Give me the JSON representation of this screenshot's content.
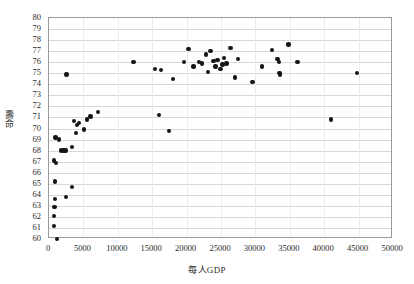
{
  "chart_data": {
    "type": "scatter",
    "title": "",
    "xlabel": "每人GDP",
    "ylabel": "壽命",
    "xlim": [
      0,
      50000
    ],
    "ylim": [
      60,
      80
    ],
    "xticks": [
      0,
      5000,
      10000,
      15000,
      20000,
      25000,
      30000,
      35000,
      40000,
      45000,
      50000
    ],
    "yticks": [
      60,
      61,
      62,
      63,
      64,
      65,
      66,
      67,
      68,
      69,
      70,
      71,
      72,
      73,
      74,
      75,
      76,
      77,
      78,
      79,
      80
    ],
    "grid": "horizontal",
    "legend": "none",
    "marker_color": "#151515",
    "series": [
      {
        "name": "國家",
        "points": [
          [
            1150,
            60.0
          ],
          [
            700,
            61.2
          ],
          [
            750,
            62.1
          ],
          [
            800,
            62.9
          ],
          [
            850,
            63.6
          ],
          [
            2450,
            63.8
          ],
          [
            900,
            65.2
          ],
          [
            3300,
            64.7
          ],
          [
            700,
            67.1
          ],
          [
            1000,
            66.9
          ],
          [
            1700,
            68.0
          ],
          [
            2100,
            68.0
          ],
          [
            2400,
            68.0
          ],
          [
            3300,
            68.3
          ],
          [
            950,
            69.2
          ],
          [
            1450,
            69.0
          ],
          [
            3950,
            69.6
          ],
          [
            4400,
            70.5
          ],
          [
            3600,
            70.7
          ],
          [
            5500,
            70.8
          ],
          [
            6050,
            71.1
          ],
          [
            4050,
            70.3
          ],
          [
            7100,
            71.5
          ],
          [
            5100,
            69.9
          ],
          [
            17400,
            69.8
          ],
          [
            16000,
            71.2
          ],
          [
            41000,
            70.8
          ],
          [
            2550,
            74.9
          ],
          [
            12300,
            76.0
          ],
          [
            15400,
            75.4
          ],
          [
            16300,
            75.3
          ],
          [
            18000,
            74.5
          ],
          [
            19600,
            76.0
          ],
          [
            20300,
            77.2
          ],
          [
            21000,
            75.6
          ],
          [
            21800,
            76.0
          ],
          [
            22200,
            75.9
          ],
          [
            22800,
            76.7
          ],
          [
            23100,
            75.1
          ],
          [
            23500,
            77.0
          ],
          [
            23900,
            76.1
          ],
          [
            24200,
            75.6
          ],
          [
            24500,
            76.2
          ],
          [
            24900,
            75.4
          ],
          [
            25200,
            75.8
          ],
          [
            25400,
            76.4
          ],
          [
            25800,
            75.9
          ],
          [
            26400,
            77.3
          ],
          [
            27000,
            74.6
          ],
          [
            27500,
            76.3
          ],
          [
            29600,
            74.2
          ],
          [
            31000,
            75.6
          ],
          [
            32400,
            77.1
          ],
          [
            33200,
            76.3
          ],
          [
            33400,
            76.0
          ],
          [
            33500,
            75.0
          ],
          [
            33600,
            74.9
          ],
          [
            34800,
            77.6
          ],
          [
            36100,
            76.0
          ],
          [
            44800,
            75.0
          ]
        ]
      }
    ]
  },
  "axis": {
    "x_title": "每人GDP",
    "y_title": "壽命"
  }
}
